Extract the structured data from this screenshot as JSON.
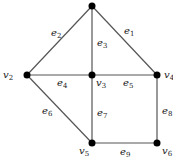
{
  "graph": {
    "line_color": "#555555",
    "node_color": "#000000",
    "vertices": [
      {
        "id": "v1",
        "label": "",
        "x": 92,
        "y": 6
      },
      {
        "id": "v2",
        "label": "v",
        "sub": "2",
        "x": 27,
        "y": 75
      },
      {
        "id": "v3",
        "label": "v",
        "sub": "3",
        "x": 92,
        "y": 75
      },
      {
        "id": "v4",
        "label": "v",
        "sub": "4",
        "x": 157,
        "y": 75
      },
      {
        "id": "v5",
        "label": "v",
        "sub": "5",
        "x": 92,
        "y": 143
      },
      {
        "id": "v6",
        "label": "v",
        "sub": "6",
        "x": 157,
        "y": 143
      }
    ],
    "edges": [
      {
        "id": "e1",
        "label": "e",
        "sub": "1",
        "from": "v1",
        "to": "v4"
      },
      {
        "id": "e2",
        "label": "e",
        "sub": "2",
        "from": "v1",
        "to": "v2"
      },
      {
        "id": "e3",
        "label": "e",
        "sub": "3",
        "from": "v1",
        "to": "v3"
      },
      {
        "id": "e4",
        "label": "e",
        "sub": "4",
        "from": "v2",
        "to": "v3"
      },
      {
        "id": "e5",
        "label": "e",
        "sub": "5",
        "from": "v3",
        "to": "v4"
      },
      {
        "id": "e6",
        "label": "e",
        "sub": "6",
        "from": "v2",
        "to": "v5"
      },
      {
        "id": "e7",
        "label": "e",
        "sub": "7",
        "from": "v3",
        "to": "v5"
      },
      {
        "id": "e8",
        "label": "e",
        "sub": "8",
        "from": "v4",
        "to": "v6"
      },
      {
        "id": "e9",
        "label": "e",
        "sub": "9",
        "from": "v5",
        "to": "v6"
      }
    ]
  }
}
